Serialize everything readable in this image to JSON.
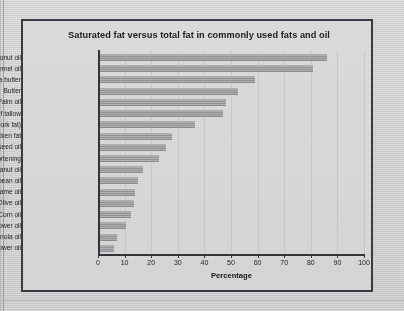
{
  "page": {
    "background_color": "#d4d4d4",
    "frame_color": "#3a3a44"
  },
  "chart_data": {
    "type": "bar",
    "orientation": "horizontal",
    "title": "Saturated fat versus total fat in commonly used fats and oil",
    "xlabel": "Percentage",
    "ylabel": "",
    "xlim": [
      0,
      100
    ],
    "xticks": [
      "0",
      "10",
      "20",
      "30",
      "40",
      "50",
      "60",
      "70",
      "80",
      "90",
      "100"
    ],
    "grid": true,
    "legend": "none",
    "bar_color": "#9b9b9b",
    "categories": [
      "Coconut oil",
      "Palm kernel oil",
      "Cocoa butter",
      "Butter",
      "Palm oil",
      "Beef tallow",
      "Lard (pork fat)",
      "Chicken fat",
      "Cottonseed oil",
      "Vegetable shortening",
      "Peanut oil",
      "Soybean oil",
      "Sesame oil",
      "Olive oil",
      "Corn oil",
      "Sunflower oil",
      "Canola oil",
      "Safflower oil"
    ],
    "values": [
      86,
      81,
      59,
      52.5,
      48,
      47,
      36.5,
      28,
      25.5,
      23,
      17,
      15,
      14,
      13.5,
      12.5,
      10.5,
      7,
      6
    ]
  }
}
